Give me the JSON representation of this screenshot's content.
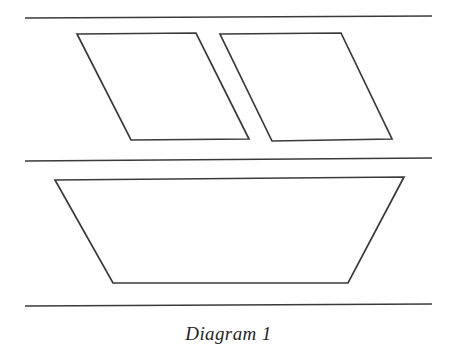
{
  "figure": {
    "caption": "Diagram 1",
    "background_color": "#ffffff",
    "stroke_color": "#3a3a3a",
    "stroke_width": 1.7,
    "canvas": {
      "width": 457,
      "height": 353
    }
  },
  "chart_data": {
    "type": "diagram",
    "title": "Diagram 1",
    "xlabel": "",
    "ylabel": "",
    "grid": false,
    "legend": "none",
    "xlim": [
      0,
      457
    ],
    "ylim": [
      0,
      353
    ],
    "guide_lines": [
      {
        "name": "top-guide-line",
        "x1": 25,
        "y1": 18,
        "x2": 432,
        "y2": 16
      },
      {
        "name": "middle-guide-line",
        "x1": 25,
        "y1": 161,
        "x2": 432,
        "y2": 158
      },
      {
        "name": "bottom-guide-line",
        "x1": 25,
        "y1": 306,
        "x2": 432,
        "y2": 304
      }
    ],
    "shapes": [
      {
        "name": "parallelogram-left",
        "kind": "parallelogram",
        "points": [
          [
            77,
            34
          ],
          [
            196,
            33
          ],
          [
            249,
            139
          ],
          [
            131,
            140
          ]
        ]
      },
      {
        "name": "parallelogram-right",
        "kind": "parallelogram",
        "points": [
          [
            220,
            34
          ],
          [
            341,
            33
          ],
          [
            392,
            139
          ],
          [
            272,
            141
          ]
        ]
      },
      {
        "name": "trapezoid-bottom",
        "kind": "trapezoid",
        "points": [
          [
            55,
            180
          ],
          [
            404,
            177
          ],
          [
            348,
            283
          ],
          [
            113,
            283
          ]
        ]
      }
    ]
  }
}
